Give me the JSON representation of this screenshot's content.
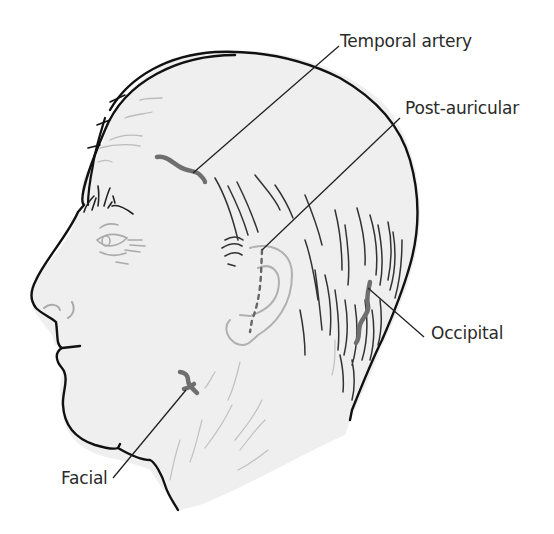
{
  "figure": {
    "colors": {
      "background": "#ffffff",
      "skin": "#efefef",
      "outline": "#111111",
      "hair": "#333333",
      "faint_detail": "#b8b8b8",
      "artery": "#6f6f6f",
      "leader_line": "#222222",
      "label_text": "#2a2a2a"
    },
    "labels": [
      {
        "id": "temporal",
        "text": "Temporal artery",
        "x": 340,
        "y": 33
      },
      {
        "id": "post-auricular",
        "text": "Post-auricular",
        "x": 405,
        "y": 100
      },
      {
        "id": "occipital",
        "text": "Occipital",
        "x": 431,
        "y": 325
      },
      {
        "id": "facial",
        "text": "Facial",
        "x": 61,
        "y": 470
      }
    ]
  }
}
